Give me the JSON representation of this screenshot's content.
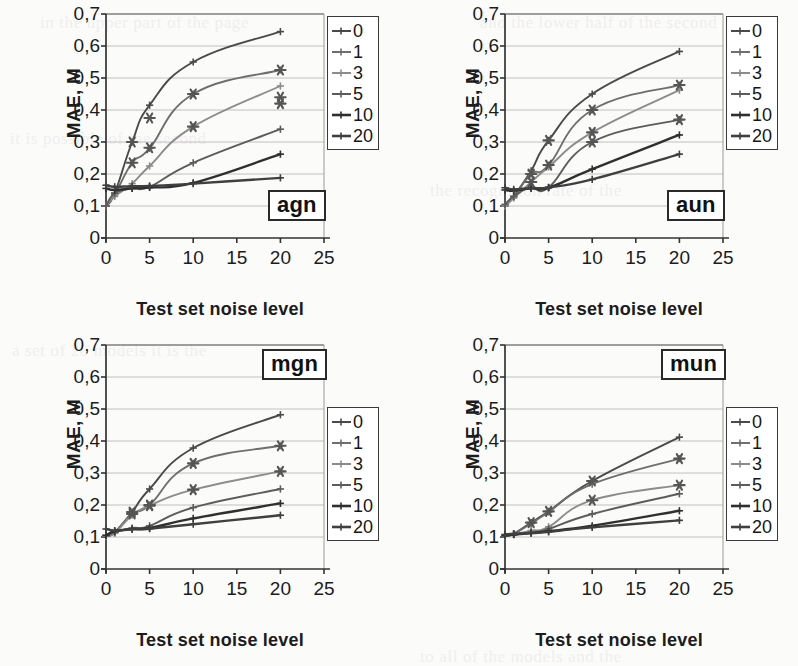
{
  "figure": {
    "axis_title_y": "MAE, M",
    "axis_title_x": "Test set noise level",
    "y_ticks": [
      "0,7",
      "0,6",
      "0,5",
      "0,4",
      "0,3",
      "0,2",
      "0,1",
      "0"
    ],
    "x_ticks": [
      "0",
      "5",
      "10",
      "15",
      "20",
      "25"
    ],
    "legend_title": "",
    "legend_entries": [
      "0",
      "1",
      "3",
      "5",
      "10",
      "20"
    ],
    "series_colors": [
      "#4a4a4a",
      "#6e6e6e",
      "#8c8c8c",
      "#5c5c5c",
      "#2f2f2f",
      "#3f3f3f"
    ]
  },
  "chart_data": [
    {
      "type": "line",
      "title": "agn",
      "xlabel": "Test set noise level",
      "ylabel": "MAE, M",
      "xlim": [
        0,
        25
      ],
      "ylim": [
        0,
        0.7
      ],
      "grid": true,
      "legend_position": "top-right",
      "x": [
        0,
        1,
        3,
        5,
        10,
        20
      ],
      "series": [
        {
          "name": "0",
          "values": [
            0.1,
            0.14,
            0.3,
            0.415,
            0.55,
            0.645
          ]
        },
        {
          "name": "1",
          "values": [
            0.1,
            0.135,
            0.235,
            0.28,
            0.45,
            0.525
          ]
        },
        {
          "name": "3",
          "values": [
            0.1,
            0.13,
            0.17,
            0.225,
            0.348,
            0.475
          ]
        },
        {
          "name": "5",
          "values": [
            0.1,
            0.14,
            0.155,
            0.16,
            0.235,
            0.34
          ]
        },
        {
          "name": "10",
          "values": [
            0.155,
            0.15,
            0.155,
            0.158,
            0.172,
            0.262
          ]
        },
        {
          "name": "20",
          "values": [
            0.165,
            0.16,
            0.162,
            0.163,
            0.17,
            0.188
          ]
        }
      ],
      "scatter_overlay": [
        {
          "x": 3,
          "y": 0.235
        },
        {
          "x": 3,
          "y": 0.3
        },
        {
          "x": 5,
          "y": 0.282
        },
        {
          "x": 5,
          "y": 0.375
        },
        {
          "x": 10,
          "y": 0.348
        },
        {
          "x": 10,
          "y": 0.45
        },
        {
          "x": 20,
          "y": 0.42
        },
        {
          "x": 20,
          "y": 0.44
        },
        {
          "x": 20,
          "y": 0.525
        }
      ]
    },
    {
      "type": "line",
      "title": "aun",
      "xlabel": "Test set noise level",
      "ylabel": "MAE, M",
      "xlim": [
        0,
        25
      ],
      "ylim": [
        0,
        0.7
      ],
      "grid": true,
      "legend_position": "top-right",
      "x": [
        0,
        1,
        3,
        5,
        10,
        20
      ],
      "series": [
        {
          "name": "0",
          "values": [
            0.1,
            0.13,
            0.21,
            0.305,
            0.45,
            0.583
          ]
        },
        {
          "name": "1",
          "values": [
            0.1,
            0.128,
            0.2,
            0.228,
            0.4,
            0.478
          ]
        },
        {
          "name": "3",
          "values": [
            0.1,
            0.125,
            0.175,
            0.222,
            0.33,
            0.462
          ]
        },
        {
          "name": "5",
          "values": [
            0.105,
            0.13,
            0.16,
            0.158,
            0.3,
            0.37
          ]
        },
        {
          "name": "10",
          "values": [
            0.15,
            0.148,
            0.155,
            0.157,
            0.215,
            0.322
          ]
        },
        {
          "name": "20",
          "values": [
            0.157,
            0.152,
            0.156,
            0.158,
            0.183,
            0.262
          ]
        }
      ],
      "scatter_overlay": [
        {
          "x": 3,
          "y": 0.2
        },
        {
          "x": 3,
          "y": 0.175
        },
        {
          "x": 5,
          "y": 0.228
        },
        {
          "x": 5,
          "y": 0.305
        },
        {
          "x": 10,
          "y": 0.3
        },
        {
          "x": 10,
          "y": 0.33
        },
        {
          "x": 10,
          "y": 0.4
        },
        {
          "x": 20,
          "y": 0.37
        },
        {
          "x": 20,
          "y": 0.478
        }
      ]
    },
    {
      "type": "line",
      "title": "mgn",
      "xlabel": "Test set noise level",
      "ylabel": "MAE, M",
      "xlim": [
        0,
        25
      ],
      "ylim": [
        0,
        0.7
      ],
      "grid": true,
      "legend_position": "right",
      "x": [
        0,
        1,
        3,
        5,
        10,
        20
      ],
      "series": [
        {
          "name": "0",
          "values": [
            0.103,
            0.115,
            0.178,
            0.25,
            0.378,
            0.482
          ]
        },
        {
          "name": "1",
          "values": [
            0.103,
            0.113,
            0.172,
            0.2,
            0.33,
            0.385
          ]
        },
        {
          "name": "3",
          "values": [
            0.103,
            0.112,
            0.168,
            0.198,
            0.248,
            0.305
          ]
        },
        {
          "name": "5",
          "values": [
            0.105,
            0.115,
            0.128,
            0.135,
            0.192,
            0.25
          ]
        },
        {
          "name": "10",
          "values": [
            0.105,
            0.118,
            0.125,
            0.128,
            0.158,
            0.205
          ]
        },
        {
          "name": "20",
          "values": [
            0.125,
            0.12,
            0.124,
            0.126,
            0.14,
            0.168
          ]
        }
      ],
      "scatter_overlay": [
        {
          "x": 3,
          "y": 0.178
        },
        {
          "x": 3,
          "y": 0.172
        },
        {
          "x": 5,
          "y": 0.2
        },
        {
          "x": 5,
          "y": 0.198
        },
        {
          "x": 10,
          "y": 0.33
        },
        {
          "x": 10,
          "y": 0.248
        },
        {
          "x": 20,
          "y": 0.385
        },
        {
          "x": 20,
          "y": 0.305
        }
      ]
    },
    {
      "type": "line",
      "title": "mun",
      "xlabel": "Test set noise level",
      "ylabel": "MAE, M",
      "xlim": [
        0,
        25
      ],
      "ylim": [
        0,
        0.7
      ],
      "grid": true,
      "legend_position": "right",
      "x": [
        0,
        1,
        3,
        5,
        10,
        20
      ],
      "series": [
        {
          "name": "0",
          "values": [
            0.103,
            0.11,
            0.145,
            0.18,
            0.275,
            0.412
          ]
        },
        {
          "name": "1",
          "values": [
            0.103,
            0.11,
            0.142,
            0.178,
            0.265,
            0.345
          ]
        },
        {
          "name": "3",
          "values": [
            0.103,
            0.108,
            0.12,
            0.132,
            0.215,
            0.262
          ]
        },
        {
          "name": "5",
          "values": [
            0.103,
            0.107,
            0.115,
            0.125,
            0.172,
            0.235
          ]
        },
        {
          "name": "10",
          "values": [
            0.105,
            0.108,
            0.112,
            0.118,
            0.135,
            0.182
          ]
        },
        {
          "name": "20",
          "values": [
            0.108,
            0.11,
            0.112,
            0.116,
            0.13,
            0.152
          ]
        }
      ],
      "scatter_overlay": [
        {
          "x": 3,
          "y": 0.145
        },
        {
          "x": 5,
          "y": 0.18
        },
        {
          "x": 10,
          "y": 0.275
        },
        {
          "x": 10,
          "y": 0.215
        },
        {
          "x": 20,
          "y": 0.345
        },
        {
          "x": 20,
          "y": 0.262
        }
      ]
    }
  ],
  "bleed_text": [
    "in the upper part of the page",
    "and the lower half of the second",
    "it is possible of the second",
    "the recognition rate of the",
    "a set of 20 models it is the",
    "to all of the models and the"
  ]
}
